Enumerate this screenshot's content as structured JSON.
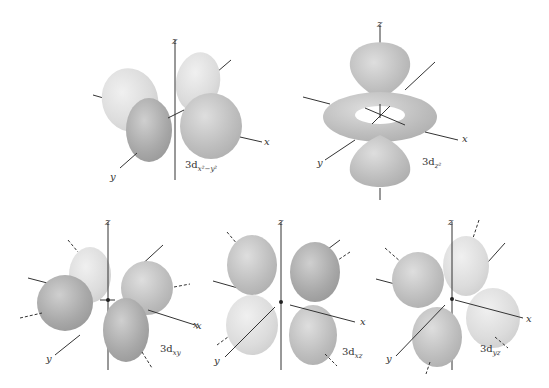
{
  "figure": {
    "colors": {
      "lobe_dark": "#a9a9a9",
      "lobe_mid": "#c2c2c2",
      "lobe_light": "#e2e2e2",
      "axis": "#333333",
      "background": "#ffffff"
    },
    "panels": [
      {
        "id": "dx2y2",
        "prefix": "3d",
        "subscript": "x²−y²",
        "axes": {
          "x": "x",
          "y": "y",
          "z": "z"
        }
      },
      {
        "id": "dz2",
        "prefix": "3d",
        "subscript": "z²",
        "axes": {
          "x": "x",
          "y": "y",
          "z": "z"
        }
      },
      {
        "id": "dxy",
        "prefix": "3d",
        "subscript": "xy",
        "axes": {
          "x": "x",
          "y": "y",
          "z": "z"
        }
      },
      {
        "id": "dxz",
        "prefix": "3d",
        "subscript": "xz",
        "axes": {
          "x": "x",
          "y": "y",
          "z": "z"
        }
      },
      {
        "id": "dyz",
        "prefix": "3d",
        "subscript": "yz",
        "axes": {
          "x": "x",
          "y": "y",
          "z": "z"
        }
      }
    ],
    "stray_labels": {
      "left_x": "x"
    }
  }
}
